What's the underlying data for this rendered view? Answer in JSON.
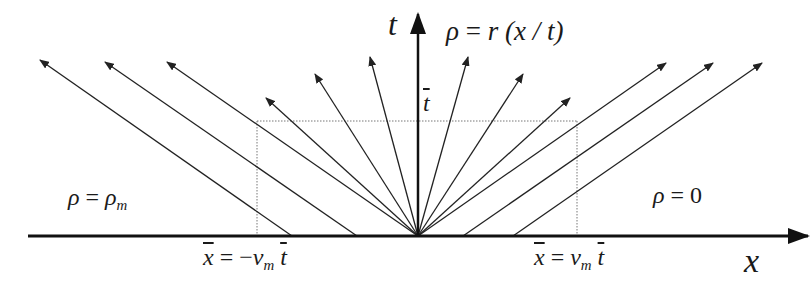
{
  "diagram": {
    "type": "characteristics-fan",
    "axes": {
      "x_label": "x",
      "t_label": "t",
      "t_bar_label": "t"
    },
    "regions": {
      "left": {
        "lhs": "ρ",
        "eq": "=",
        "rhs": "ρ",
        "rhs_sub": "m"
      },
      "right": {
        "lhs": "ρ",
        "eq": "=",
        "rhs": "0"
      },
      "fan": {
        "lhs": "ρ",
        "eq": "=",
        "rhs": "r",
        "arg": "(x / t)"
      }
    },
    "markers": {
      "left": {
        "lhs": "x",
        "eq": "= −",
        "v": "v",
        "v_sub": "m",
        "t": "t"
      },
      "right": {
        "lhs": "x",
        "eq": "=",
        "v": "v",
        "v_sub": "m",
        "t": "t"
      }
    },
    "colors": {
      "line": "#222222",
      "dotted": "#777777",
      "background": "#ffffff"
    }
  }
}
